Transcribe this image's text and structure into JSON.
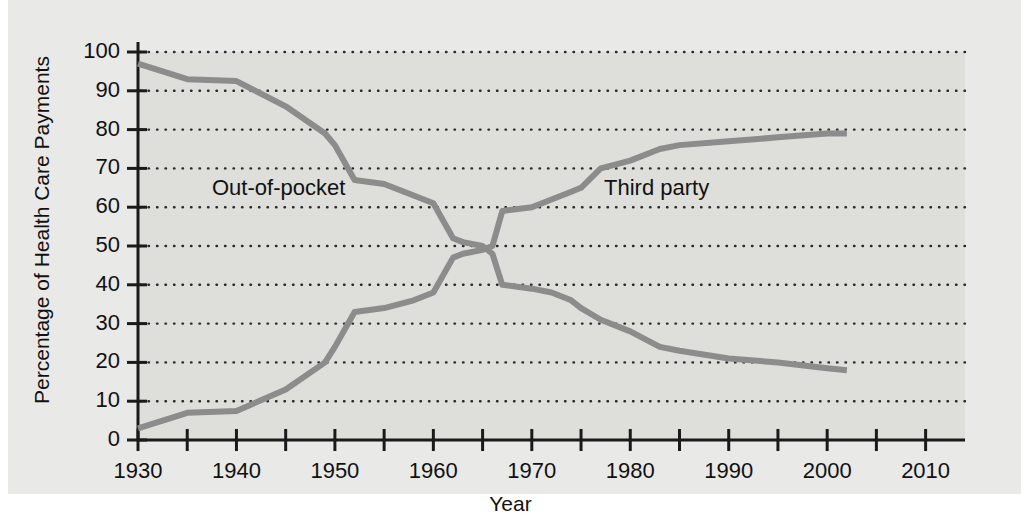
{
  "figure": {
    "background_color": "#e9e9e7",
    "plot_background_color": "#dededa",
    "axis_color": "#1a1a1a",
    "gridline_color": "#2a2a2a"
  },
  "axes": {
    "x_title": "Year",
    "y_title": "Percentage of Health Care Payments",
    "x_tick_labels": [
      "1930",
      "1940",
      "1950",
      "1960",
      "1970",
      "1980",
      "1990",
      "2000",
      "2010"
    ],
    "x_minor_ticks": [
      1935,
      1945,
      1955,
      1965,
      1975,
      1985,
      1995,
      2005
    ],
    "y_tick_labels": [
      "0",
      "10",
      "20",
      "30",
      "40",
      "50",
      "60",
      "70",
      "80",
      "90",
      "100"
    ]
  },
  "series_labels": {
    "out_of_pocket": "Out-of-pocket",
    "third_party": "Third party"
  },
  "chart_data": {
    "type": "line",
    "title": "",
    "xlabel": "Year",
    "ylabel": "Percentage of Health Care Payments",
    "xlim": [
      1930,
      2014
    ],
    "ylim": [
      0,
      100
    ],
    "grid": true,
    "grid_style": "dotted-horizontal",
    "legend": "inline-annotations",
    "line_color": "#8c8c8c",
    "line_width": 6,
    "series": [
      {
        "name": "Out-of-pocket",
        "color": "#8c8c8c",
        "label_position": {
          "x": 1938,
          "y": 65
        },
        "x": [
          1930,
          1935,
          1940,
          1945,
          1949,
          1950,
          1952,
          1955,
          1958,
          1960,
          1962,
          1963,
          1965,
          1966,
          1967,
          1970,
          1972,
          1974,
          1975,
          1977,
          1980,
          1983,
          1985,
          1990,
          1995,
          2000,
          2002
        ],
        "y": [
          97,
          93,
          92.5,
          86,
          79,
          76,
          67,
          66,
          63,
          61,
          52,
          51,
          50,
          48,
          40,
          39,
          38,
          36,
          34,
          31,
          28,
          24,
          23,
          21,
          20,
          18.5,
          18
        ]
      },
      {
        "name": "Third party",
        "color": "#8c8c8c",
        "label_position": {
          "x": 1977,
          "y": 65
        },
        "x": [
          1930,
          1935,
          1940,
          1945,
          1949,
          1950,
          1952,
          1955,
          1958,
          1960,
          1962,
          1963,
          1965,
          1966,
          1967,
          1970,
          1972,
          1974,
          1975,
          1977,
          1980,
          1983,
          1985,
          1990,
          1995,
          2000,
          2002
        ],
        "y": [
          3,
          7,
          7.5,
          13,
          20,
          24,
          33,
          34,
          36,
          38,
          47,
          48,
          49,
          50,
          59,
          60,
          62,
          64,
          65,
          70,
          72,
          75,
          76,
          77,
          78,
          79,
          79
        ]
      }
    ]
  }
}
